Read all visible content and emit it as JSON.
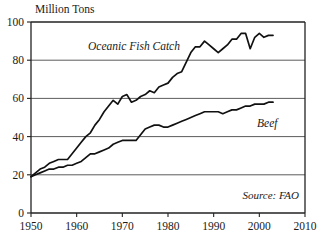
{
  "chart_data": {
    "type": "line",
    "title": "",
    "ylabel": "Million Tons",
    "xlabel": "",
    "xlim": [
      1950,
      2010
    ],
    "ylim": [
      0,
      100
    ],
    "xticks": [
      1950,
      1960,
      1970,
      1980,
      1990,
      2000,
      2010
    ],
    "yticks": [
      0,
      20,
      40,
      60,
      80,
      100
    ],
    "grid": "horizontal",
    "legend_position": "inline-annotations",
    "annotations": [
      {
        "name": "source-note",
        "text": "Source: FAO"
      }
    ],
    "series": [
      {
        "name": "Oceanic Fish Catch",
        "label": "Oceanic Fish Catch",
        "x": [
          1950,
          1951,
          1952,
          1953,
          1954,
          1955,
          1956,
          1957,
          1958,
          1959,
          1960,
          1961,
          1962,
          1963,
          1964,
          1965,
          1966,
          1967,
          1968,
          1969,
          1970,
          1971,
          1972,
          1973,
          1974,
          1975,
          1976,
          1977,
          1978,
          1979,
          1980,
          1981,
          1982,
          1983,
          1984,
          1985,
          1986,
          1987,
          1988,
          1989,
          1990,
          1991,
          1992,
          1993,
          1994,
          1995,
          1996,
          1997,
          1998,
          1999,
          2000,
          2001,
          2002,
          2003
        ],
        "values": [
          19,
          21,
          23,
          24,
          26,
          27,
          28,
          28,
          28,
          31,
          34,
          37,
          40,
          42,
          46,
          49,
          53,
          56,
          59,
          57,
          61,
          62,
          58,
          59,
          61,
          62,
          64,
          63,
          66,
          67,
          68,
          71,
          73,
          74,
          79,
          84,
          87,
          87,
          90,
          88,
          86,
          84,
          86,
          88,
          91,
          91,
          94,
          94,
          86,
          92,
          94,
          92,
          93,
          93
        ]
      },
      {
        "name": "Beef",
        "label": "Beef",
        "x": [
          1950,
          1951,
          1952,
          1953,
          1954,
          1955,
          1956,
          1957,
          1958,
          1959,
          1960,
          1961,
          1962,
          1963,
          1964,
          1965,
          1966,
          1967,
          1968,
          1969,
          1970,
          1971,
          1972,
          1973,
          1974,
          1975,
          1976,
          1977,
          1978,
          1979,
          1980,
          1981,
          1982,
          1983,
          1984,
          1985,
          1986,
          1987,
          1988,
          1989,
          1990,
          1991,
          1992,
          1993,
          1994,
          1995,
          1996,
          1997,
          1998,
          1999,
          2000,
          2001,
          2002,
          2003
        ],
        "values": [
          19,
          20,
          21,
          22,
          23,
          23,
          24,
          24,
          25,
          25,
          26,
          27,
          29,
          31,
          31,
          32,
          33,
          34,
          36,
          37,
          38,
          38,
          38,
          38,
          41,
          44,
          45,
          46,
          46,
          45,
          45,
          46,
          47,
          48,
          49,
          50,
          51,
          52,
          53,
          53,
          53,
          53,
          52,
          53,
          54,
          54,
          55,
          56,
          56,
          57,
          57,
          57,
          58,
          58
        ]
      }
    ]
  },
  "labels": {
    "y_axis_title": "Million Tons",
    "series_fish": "Oceanic Fish Catch",
    "series_beef": "Beef",
    "source": "Source: FAO"
  },
  "colors": {
    "line": "#111111",
    "grid": "#4a4a4a",
    "frame": "#222222",
    "background": "#ffffff",
    "text": "#1a1a1a"
  }
}
